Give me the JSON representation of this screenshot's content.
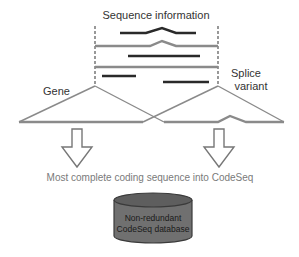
{
  "title": "Sequence information",
  "labels": {
    "gene": "Gene",
    "splice_line1": "Splice",
    "splice_line2": "variant"
  },
  "caption": "Most complete coding sequence into CodeSeq",
  "database": {
    "line1": "Non-redundant",
    "line2": "CodeSeq database"
  },
  "colors": {
    "dark_line": "#2a2a2a",
    "gray_line": "#8a8a8a",
    "text": "#333333",
    "caption_text": "#7a7a7a",
    "db_fill": "#707070",
    "db_top": "#5e5e5e",
    "db_stroke": "#3a3a3a"
  }
}
